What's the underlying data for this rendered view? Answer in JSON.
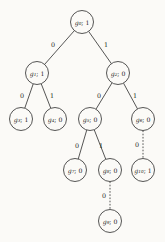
{
  "figure": {
    "type": "binary-decision-tree",
    "background_color": "#fbfaf7",
    "stroke_color": "#2b2b2b",
    "node_radius": 11.5
  },
  "chart_data": {
    "type": "diagram",
    "title": "",
    "nodes": [
      {
        "id": "g0",
        "name": "g",
        "subscript": "0",
        "separator": "; ",
        "value": "1",
        "cx": 82,
        "cy": 22,
        "level": 0
      },
      {
        "id": "g1",
        "name": "g",
        "subscript": "1",
        "separator": "; ",
        "value": "1",
        "cx": 37,
        "cy": 73,
        "level": 1
      },
      {
        "id": "g2",
        "name": "g",
        "subscript": "2",
        "separator": "; ",
        "value": "0",
        "cx": 118,
        "cy": 73,
        "level": 1
      },
      {
        "id": "g3",
        "name": "g",
        "subscript": "3",
        "separator": "; ",
        "value": "1",
        "cx": 21,
        "cy": 119,
        "level": 2
      },
      {
        "id": "g4",
        "name": "g",
        "subscript": "4",
        "separator": "; ",
        "value": "0",
        "cx": 55,
        "cy": 119,
        "level": 2
      },
      {
        "id": "g5",
        "name": "g",
        "subscript": "5",
        "separator": "; ",
        "value": "0",
        "cx": 90,
        "cy": 119,
        "level": 2
      },
      {
        "id": "g6",
        "name": "g",
        "subscript": "6",
        "separator": "; ",
        "value": "0",
        "cx": 143,
        "cy": 119,
        "level": 2
      },
      {
        "id": "g7",
        "name": "g",
        "subscript": "7",
        "separator": "; ",
        "value": "0",
        "cx": 75,
        "cy": 170,
        "level": 3
      },
      {
        "id": "g8",
        "name": "g",
        "subscript": "8",
        "separator": "; ",
        "value": "0",
        "cx": 110,
        "cy": 170,
        "level": 3
      },
      {
        "id": "g10",
        "name": "g",
        "subscript": "10",
        "separator": "; ",
        "value": "1",
        "cx": 143,
        "cy": 170,
        "level": 3
      },
      {
        "id": "g9",
        "name": "g",
        "subscript": "9",
        "separator": "; ",
        "value": "0",
        "cx": 110,
        "cy": 221,
        "level": 4
      }
    ],
    "edges": [
      {
        "from": "g0",
        "to": "g1",
        "label": "0",
        "style": "solid",
        "lx": 53,
        "ly": 45
      },
      {
        "from": "g0",
        "to": "g2",
        "label": "1",
        "style": "solid",
        "lx": 106,
        "ly": 45
      },
      {
        "from": "g1",
        "to": "g3",
        "label": "0",
        "style": "solid",
        "lx": 22,
        "ly": 96
      },
      {
        "from": "g1",
        "to": "g4",
        "label": "1",
        "style": "solid",
        "lx": 52,
        "ly": 96
      },
      {
        "from": "g2",
        "to": "g5",
        "label": "0",
        "style": "solid",
        "lx": 99,
        "ly": 96
      },
      {
        "from": "g2",
        "to": "g6",
        "label": "1",
        "style": "solid",
        "lx": 135,
        "ly": 96
      },
      {
        "from": "g5",
        "to": "g7",
        "label": "0",
        "style": "solid",
        "lx": 77,
        "ly": 146
      },
      {
        "from": "g5",
        "to": "g8",
        "label": "1",
        "style": "solid",
        "lx": 101,
        "ly": 146
      },
      {
        "from": "g6",
        "to": "g10",
        "label": "0",
        "style": "dashed",
        "lx": 137,
        "ly": 145
      },
      {
        "from": "g8",
        "to": "g9",
        "label": "0",
        "style": "dashed",
        "lx": 104,
        "ly": 196
      }
    ]
  }
}
